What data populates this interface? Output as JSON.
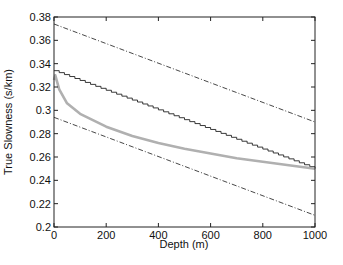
{
  "chart_data": {
    "type": "line",
    "title": "",
    "xlabel": "Depth (m)",
    "ylabel": "True Slowness (s/km)",
    "xlim": [
      0,
      1000
    ],
    "ylim": [
      0.2,
      0.38
    ],
    "xticks": [
      "0",
      "200",
      "400",
      "600",
      "800",
      "1000"
    ],
    "yticks": [
      "0.2",
      "0.22",
      "0.24",
      "0.26",
      "0.28",
      "0.3",
      "0.32",
      "0.34",
      "0.36",
      "0.38"
    ],
    "grid": false,
    "legend": null,
    "series": [
      {
        "name": "upper-bound",
        "style": "dash-dot",
        "color": "#333333",
        "x": [
          0,
          1000
        ],
        "values": [
          0.374,
          0.29
        ]
      },
      {
        "name": "staircase-model",
        "style": "solid-staircase",
        "color": "#222222",
        "x": [
          0,
          1000
        ],
        "values": [
          0.334,
          0.25
        ]
      },
      {
        "name": "true-slowness",
        "style": "solid-thick",
        "color": "#b0b0b0",
        "x": [
          0,
          5,
          20,
          50,
          100,
          200,
          300,
          400,
          500,
          600,
          700,
          800,
          900,
          1000
        ],
        "values": [
          0.326,
          0.33,
          0.318,
          0.306,
          0.297,
          0.286,
          0.278,
          0.272,
          0.267,
          0.263,
          0.259,
          0.256,
          0.253,
          0.25
        ]
      },
      {
        "name": "lower-bound",
        "style": "dash-dot",
        "color": "#333333",
        "x": [
          0,
          1000
        ],
        "values": [
          0.294,
          0.21
        ]
      }
    ]
  }
}
